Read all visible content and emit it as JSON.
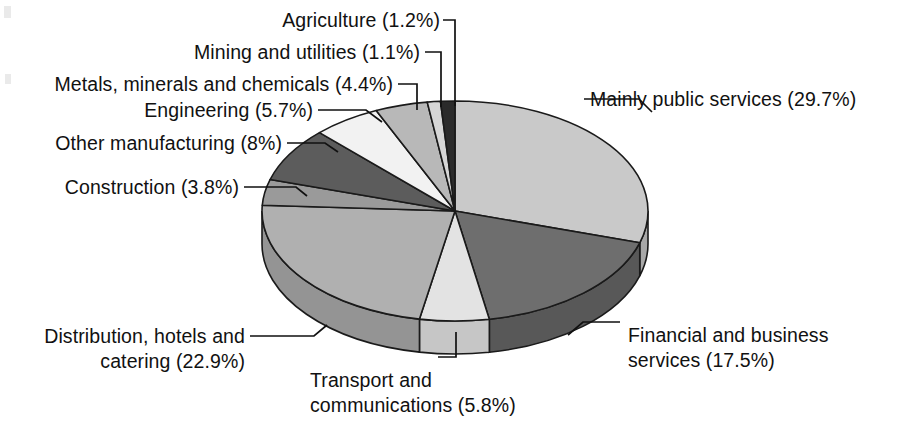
{
  "chart_data": {
    "type": "pie",
    "title": "",
    "subtitle": "",
    "xlabel": "",
    "ylabel": "",
    "legend_position": "callout-labels",
    "grid": false,
    "style": "3d-exploded-none",
    "units": "percent",
    "start_angle_deg": 0,
    "direction": "clockwise",
    "categories": [
      "Mainly public services",
      "Financial and business services",
      "Transport and communications",
      "Distribution, hotels and catering",
      "Construction",
      "Other manufacturing",
      "Engineering",
      "Metals, minerals and chemicals",
      "Mining and utilities",
      "Agriculture"
    ],
    "values": [
      29.7,
      17.5,
      5.8,
      22.9,
      3.8,
      8.0,
      5.7,
      4.4,
      1.1,
      1.2
    ],
    "value_labels": [
      "29.7%",
      "17.5%",
      "5.8%",
      "22.9%",
      "3.8%",
      "8%",
      "5.7%",
      "4.4%",
      "1.1%",
      "1.2%"
    ],
    "slice_colors": [
      "#c9c9c9",
      "#6e6e6e",
      "#e3e3e3",
      "#b0b0b0",
      "#9a9a9a",
      "#5c5c5c",
      "#f2f2f2",
      "#b8b8b8",
      "#d6d6d6",
      "#2b2b2b"
    ],
    "side_colors": [
      "#a8a8a8",
      "#585858",
      "#c6c6c6",
      "#949494",
      "#808080",
      "#4a4a4a",
      "#d4d4d4",
      "#9b9b9b",
      "#b6b6b6",
      "#222222"
    ],
    "outline_color": "#1a1a1a"
  },
  "callouts": [
    {
      "id": "agriculture",
      "text": "Agriculture (1.2%)"
    },
    {
      "id": "mining",
      "text": "Mining and utilities (1.1%)"
    },
    {
      "id": "metals",
      "text": "Metals, minerals and chemicals (4.4%)"
    },
    {
      "id": "engineering",
      "text": "Engineering (5.7%)"
    },
    {
      "id": "other-manufact",
      "text": "Other manufacturing (8%)"
    },
    {
      "id": "construction",
      "text": "Construction (3.8%)"
    },
    {
      "id": "public-services",
      "text": "Mainly public services (29.7%)"
    },
    {
      "id": "distribution-l1",
      "text": "Distribution, hotels and"
    },
    {
      "id": "distribution-l2",
      "text": "catering (22.9%)"
    },
    {
      "id": "transport-l1",
      "text": "Transport and"
    },
    {
      "id": "transport-l2",
      "text": "communications (5.8%)"
    },
    {
      "id": "financial-l1",
      "text": "Financial and business"
    },
    {
      "id": "financial-l2",
      "text": "services (17.5%)"
    }
  ]
}
